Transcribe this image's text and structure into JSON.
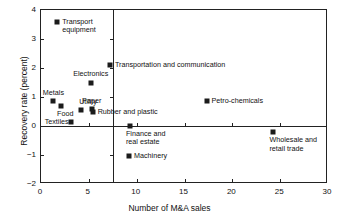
{
  "chart_data": {
    "type": "scatter",
    "title": "",
    "xlabel": "Number of M&A sales",
    "ylabel": "Recovery rate (percent)",
    "xlim": [
      0,
      30
    ],
    "ylim": [
      -2,
      4
    ],
    "xticks": [
      0,
      5,
      10,
      15,
      20,
      25,
      30
    ],
    "yticks": [
      -2,
      -1,
      0,
      1,
      2,
      3,
      4
    ],
    "xticklabels": [
      "0",
      "5",
      "10",
      "15",
      "20",
      "25",
      "30"
    ],
    "yticklabels": [
      "−2",
      "−1",
      "0",
      "1",
      "2",
      "3",
      "4"
    ],
    "grid": false,
    "legend": "none",
    "reference_lines": [
      {
        "orientation": "vertical",
        "value": 7.5
      },
      {
        "orientation": "horizontal",
        "value": 0
      }
    ],
    "points": [
      {
        "label": "Transport\nequipment",
        "x": 1.7,
        "y": 3.6,
        "label_pos": "right"
      },
      {
        "label": "Transportation and communication",
        "x": 7.2,
        "y": 2.1,
        "label_pos": "right"
      },
      {
        "label": "Electronics",
        "x": 5.2,
        "y": 1.5,
        "label_pos": "above"
      },
      {
        "label": "Metals",
        "x": 1.3,
        "y": 0.87,
        "label_pos": "above"
      },
      {
        "label": "Food",
        "x": 2.1,
        "y": 0.7,
        "label_pos": "below"
      },
      {
        "label": "Utility",
        "x": 4.2,
        "y": 0.55,
        "label_pos": "above-left"
      },
      {
        "label": "Paper",
        "x": 5.3,
        "y": 0.57,
        "label_pos": "above"
      },
      {
        "label": "Rubber and plastic",
        "x": 5.4,
        "y": 0.5,
        "label_pos": "right"
      },
      {
        "label": "Textiles",
        "x": 3.1,
        "y": 0.13,
        "label_pos": "left"
      },
      {
        "label": "Petro-chemicals",
        "x": 17.3,
        "y": 0.85,
        "label_pos": "right"
      },
      {
        "label": "Finance and\nreal estate",
        "x": 9.3,
        "y": 0.0,
        "label_pos": "below"
      },
      {
        "label": "Wholesale and\nretail trade",
        "x": 24.3,
        "y": -0.22,
        "label_pos": "below"
      },
      {
        "label": "Machinery",
        "x": 9.2,
        "y": -1.02,
        "label_pos": "right"
      }
    ]
  },
  "axes": {
    "x_title": "Number of M&A sales",
    "y_title": "Recovery rate (percent)",
    "x_tick_labels": [
      "0",
      "5",
      "10",
      "15",
      "20",
      "25",
      "30"
    ],
    "y_tick_labels": [
      "4",
      "3",
      "2",
      "1",
      "0",
      "−1",
      "−2"
    ]
  },
  "series_labels": {
    "transport_equipment": "Transport\nequipment",
    "transportation_communication": "Transportation and communication",
    "electronics": "Electronics",
    "metals": "Metals",
    "food": "Food",
    "utility": "Utility",
    "paper": "Paper",
    "rubber_plastic": "Rubber and plastic",
    "textiles": "Textiles",
    "petro_chemicals": "Petro-chemicals",
    "finance_real_estate": "Finance and\nreal estate",
    "wholesale_retail_trade": "Wholesale and\nretail trade",
    "machinery": "Machinery"
  },
  "colors": {
    "marker": "#1b1b1b",
    "axis": "#222222",
    "background": "#ffffff",
    "text": "#111111"
  }
}
